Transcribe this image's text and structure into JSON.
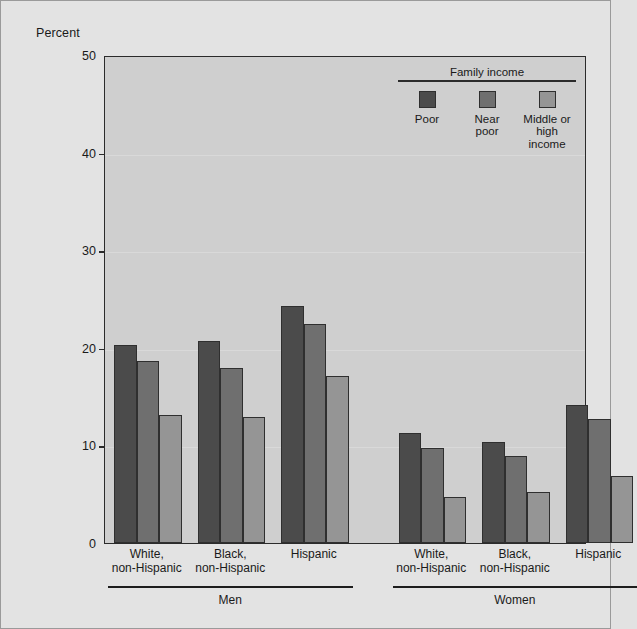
{
  "chart_data": {
    "type": "bar",
    "title": "",
    "ylabel": "Percent",
    "xlabel": "",
    "ylim": [
      0,
      50
    ],
    "yticks": [
      0,
      10,
      20,
      30,
      40,
      50
    ],
    "grid": true,
    "legend_position": "top-right",
    "legend_title": "Family income",
    "categories": [
      "White,\nnon-Hispanic",
      "Black,\nnon-Hispanic",
      "Hispanic",
      "White,\nnon-Hispanic",
      "Black,\nnon-Hispanic",
      "Hispanic"
    ],
    "groups": [
      {
        "label": "Men",
        "categories": [
          0,
          1,
          2
        ]
      },
      {
        "label": "Women",
        "categories": [
          3,
          4,
          5
        ]
      }
    ],
    "series": [
      {
        "name": "Poor",
        "color": "#4b4b4b",
        "values": [
          20.3,
          20.7,
          24.3,
          11.3,
          10.4,
          14.1
        ]
      },
      {
        "name": "Near\npoor",
        "color": "#6f6f6f",
        "values": [
          18.6,
          17.9,
          22.4,
          9.7,
          8.9,
          12.7
        ]
      },
      {
        "name": "Middle or\nhigh income",
        "color": "#959595",
        "values": [
          13.1,
          12.9,
          17.1,
          4.7,
          5.2,
          6.9
        ]
      }
    ]
  },
  "axis": {
    "y_title": "Percent",
    "tick_labels": [
      "0",
      "10",
      "20",
      "30",
      "40",
      "50"
    ]
  },
  "legend": {
    "title": "Family income",
    "items": [
      {
        "label": "Poor",
        "color": "#4b4b4b"
      },
      {
        "label": "Near\npoor",
        "color": "#6f6f6f"
      },
      {
        "label": "Middle or\nhigh income",
        "color": "#959595"
      }
    ]
  },
  "x_categories": [
    "White,\nnon-Hispanic",
    "Black,\nnon-Hispanic",
    "Hispanic",
    "White,\nnon-Hispanic",
    "Black,\nnon-Hispanic",
    "Hispanic"
  ],
  "sex_groups": [
    {
      "label": "Men"
    },
    {
      "label": "Women"
    }
  ],
  "colors": {
    "poor": "#4b4b4b",
    "near_poor": "#6f6f6f",
    "middle_high": "#959595",
    "plot_background": "#cfcfcf",
    "figure_background": "#e3e3e3",
    "axis": "#2b2b2b"
  }
}
